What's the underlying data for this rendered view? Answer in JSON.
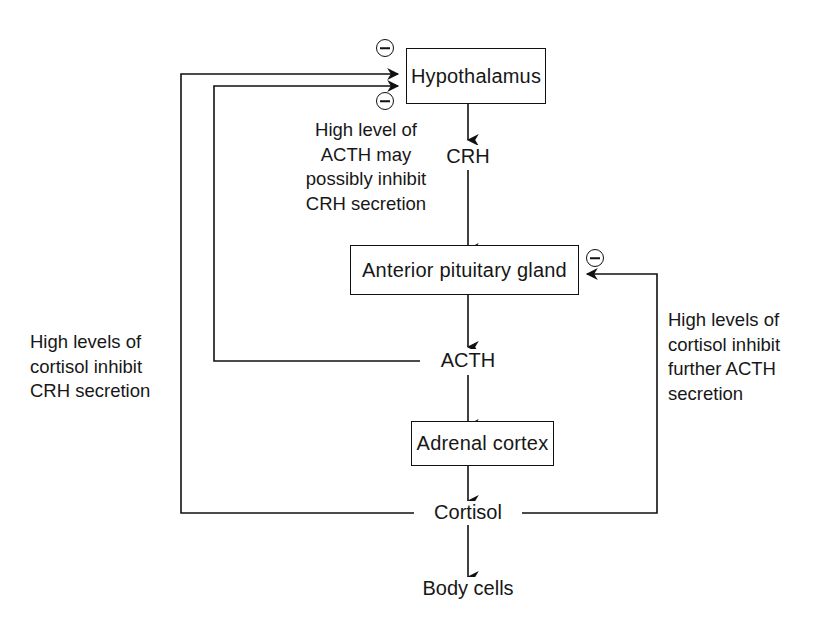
{
  "diagram": {
    "line_color": "#111111",
    "background_color": "#ffffff",
    "nodes": [
      {
        "id": "hypothalamus",
        "label": "Hypothalamus",
        "x": 406,
        "y": 48,
        "w": 140,
        "h": 56
      },
      {
        "id": "pituitary",
        "label": "Anterior pituitary gland",
        "x": 350,
        "y": 245,
        "w": 229,
        "h": 50
      },
      {
        "id": "adrenal",
        "label": "Adrenal cortex",
        "x": 411,
        "y": 421,
        "w": 143,
        "h": 45
      }
    ],
    "inline_labels": [
      {
        "id": "crh",
        "label": "CRH",
        "cx": 468,
        "cy": 157
      },
      {
        "id": "acth",
        "label": "ACTH",
        "cx": 468,
        "cy": 361
      },
      {
        "id": "cortisol",
        "label": "Cortisol",
        "cx": 468,
        "cy": 513
      },
      {
        "id": "body-cells",
        "label": "Body cells",
        "cx": 468,
        "cy": 589
      }
    ],
    "annotations": [
      {
        "id": "acth-inhibits-crh",
        "text": "High level of\nACTH may\npossibly inhibit\nCRH secretion",
        "x": 290,
        "y": 118,
        "align": "centered"
      },
      {
        "id": "cortisol-inhibits-crh",
        "text": "High levels of\ncortisol inhibit\nCRH secretion",
        "x": 30,
        "y": 330,
        "align": "left"
      },
      {
        "id": "cortisol-inhibits-acth",
        "text": "High levels of\ncortisol inhibit\nfurther ACTH\nsecretion",
        "x": 668,
        "y": 308,
        "align": "left"
      }
    ],
    "sign_badges": [
      {
        "id": "minus-hypothalamus-upper",
        "sign": "minus",
        "cx": 385,
        "cy": 48
      },
      {
        "id": "minus-hypothalamus-lower",
        "sign": "minus",
        "cx": 385,
        "cy": 101
      },
      {
        "id": "minus-pituitary",
        "sign": "minus",
        "cx": 595,
        "cy": 258
      }
    ],
    "edges": [
      {
        "id": "hypothalamus-to-crh",
        "from": "hypothalamus",
        "to": "crh",
        "kind": "stimulatory"
      },
      {
        "id": "crh-to-pituitary",
        "from": "crh",
        "to": "pituitary",
        "kind": "stimulatory"
      },
      {
        "id": "pituitary-to-acth",
        "from": "pituitary",
        "to": "acth",
        "kind": "stimulatory"
      },
      {
        "id": "acth-to-adrenal",
        "from": "acth",
        "to": "adrenal",
        "kind": "stimulatory"
      },
      {
        "id": "adrenal-to-cortisol",
        "from": "adrenal",
        "to": "cortisol",
        "kind": "stimulatory"
      },
      {
        "id": "cortisol-to-body-cells",
        "from": "cortisol",
        "to": "body-cells",
        "kind": "stimulatory"
      },
      {
        "id": "acth-feedback-to-hypothalamus",
        "from": "acth",
        "to": "hypothalamus",
        "kind": "inhibitory"
      },
      {
        "id": "cortisol-feedback-to-hypothalamus",
        "from": "cortisol",
        "to": "hypothalamus",
        "kind": "inhibitory"
      },
      {
        "id": "cortisol-feedback-to-pituitary",
        "from": "cortisol",
        "to": "pituitary",
        "kind": "inhibitory"
      }
    ]
  }
}
